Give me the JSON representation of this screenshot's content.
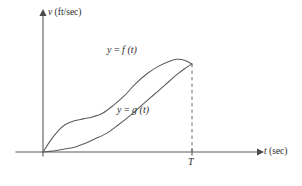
{
  "figure": {
    "background_color": "#ffffff",
    "stroke_color": "#5c5c5c",
    "text_color": "#2b2b2b",
    "axes": {
      "y_axis": {
        "label_variable": "v",
        "label_units": "(ft/sec)",
        "arrow": "up-arrow-icon"
      },
      "x_axis": {
        "label_variable": "t",
        "label_units": "(sec)",
        "arrow": "right-arrow-icon"
      },
      "tick_labels": [
        "T"
      ]
    },
    "curves": [
      {
        "name": "f",
        "label_prefix": "y",
        "label_equals": "=",
        "label_function": "f",
        "label_argument": "(t)",
        "label_full": "y = f (t)"
      },
      {
        "name": "g",
        "label_prefix": "y",
        "label_equals": "=",
        "label_function": "g",
        "label_argument": "(t)",
        "label_full": "y = g (t)"
      }
    ],
    "annotations": {
      "drop_line": "dashed vertical line at T"
    }
  },
  "chart_data": {
    "type": "line",
    "title": "",
    "xlabel": "t (sec)",
    "ylabel": "v (ft/sec)",
    "grid": false,
    "legend": "inline-curve-labels",
    "xlim": [
      0,
      1.25
    ],
    "ylim": [
      0,
      1.15
    ],
    "x_tick_values": [
      1
    ],
    "x_tick_labels": [
      "T"
    ],
    "y_tick_values": [],
    "y_tick_labels": [],
    "annotations": [
      {
        "kind": "vertical-dashed-line",
        "x": 1,
        "y_from": 0,
        "y_to": 0.93,
        "label": "T"
      },
      {
        "kind": "meeting-point",
        "x": 1,
        "y": 0.93,
        "note": "f and g meet at t = T"
      }
    ],
    "series": [
      {
        "name": "y = f (t)",
        "x": [
          0.0,
          0.05,
          0.1,
          0.15,
          0.21,
          0.27,
          0.33,
          0.4,
          0.47,
          0.55,
          0.62,
          0.7,
          0.78,
          0.85,
          0.9,
          0.95,
          1.0
        ],
        "values": [
          0.0,
          0.12,
          0.22,
          0.29,
          0.33,
          0.35,
          0.37,
          0.41,
          0.49,
          0.6,
          0.72,
          0.83,
          0.91,
          0.96,
          0.98,
          0.97,
          0.93
        ]
      },
      {
        "name": "y = g (t)",
        "x": [
          0.0,
          0.07,
          0.14,
          0.21,
          0.28,
          0.35,
          0.43,
          0.5,
          0.58,
          0.66,
          0.74,
          0.82,
          0.9,
          0.95,
          1.0
        ],
        "values": [
          0.0,
          0.01,
          0.03,
          0.05,
          0.09,
          0.14,
          0.2,
          0.28,
          0.38,
          0.49,
          0.6,
          0.71,
          0.82,
          0.88,
          0.93
        ]
      }
    ]
  }
}
